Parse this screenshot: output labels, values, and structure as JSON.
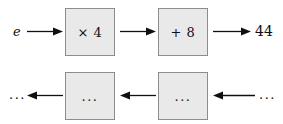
{
  "diagram": {
    "colors": {
      "box_fill": "#e9e9e9",
      "box_border": "#8d8d8d",
      "stroke": "#101010",
      "background": "#ffffff"
    },
    "forward_row": {
      "input_label": "e",
      "boxes": [
        {
          "id": "mul4",
          "label": "× 4"
        },
        {
          "id": "add8",
          "label": "+ 8"
        }
      ],
      "output_label": "44",
      "arrows": [
        {
          "id": "e-to-mul4",
          "direction": "right"
        },
        {
          "id": "mul4-to-add8",
          "direction": "right"
        },
        {
          "id": "add8-to-44",
          "direction": "right"
        }
      ]
    },
    "inverse_row": {
      "input_label": "...",
      "boxes": [
        {
          "id": "inv1",
          "label": "..."
        },
        {
          "id": "inv2",
          "label": "..."
        }
      ],
      "output_label": "...",
      "arrows": [
        {
          "id": "inv1-to-out",
          "direction": "left"
        },
        {
          "id": "inv2-to-inv1",
          "direction": "left"
        },
        {
          "id": "in-to-inv2",
          "direction": "left"
        }
      ]
    }
  }
}
